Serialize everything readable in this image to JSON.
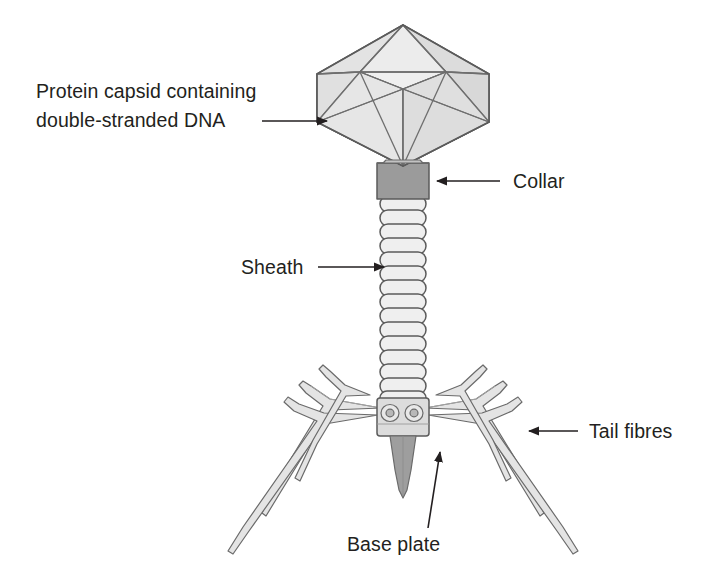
{
  "diagram": {
    "background_color": "#ffffff",
    "line_color": "#5b5b5b",
    "text_color": "#231f20",
    "labels": [
      {
        "id": "capsid",
        "line1": "Protein capsid containing",
        "line2": "double-stranded DNA",
        "arrow_direction": "right"
      },
      {
        "id": "collar",
        "text": "Collar",
        "arrow_direction": "left"
      },
      {
        "id": "sheath",
        "text": "Sheath",
        "arrow_direction": "right"
      },
      {
        "id": "tail-fibres",
        "text": "Tail fibres",
        "arrow_direction": "left"
      },
      {
        "id": "base-plate",
        "text": "Base plate",
        "arrow_direction": "up-left"
      }
    ],
    "parts": {
      "capsid": {
        "name": "Protein capsid (icosahedral head)",
        "fill_light": "#e9e9e9",
        "fill_mid": "#dedede",
        "fill_shade": "#c9c9c9"
      },
      "collar": {
        "name": "Collar",
        "fill": "#9b9b9b"
      },
      "sheath": {
        "name": "Contractile sheath",
        "fill": "#efefef",
        "segment_count": 15
      },
      "base_plate": {
        "name": "Base plate",
        "fill": "#dcdcdc"
      },
      "tail_pin": {
        "name": "Tail pin / core",
        "fill": "#9e9e9e"
      },
      "tail_fibres": {
        "name": "Tail fibres",
        "fill": "#e4e4e4",
        "count": 6
      }
    }
  }
}
